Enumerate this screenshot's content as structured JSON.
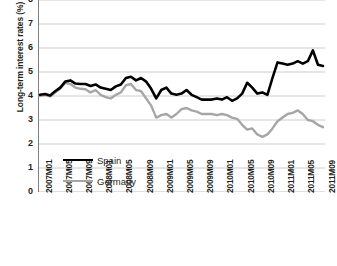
{
  "chart_data": {
    "type": "line",
    "title": "",
    "xlabel": "",
    "ylabel": "Long-term interest rates (%)",
    "ylim": [
      0,
      8
    ],
    "yticks": [
      0,
      1,
      2,
      3,
      4,
      5,
      6,
      7,
      8
    ],
    "ytick_labels": [
      "0",
      "1",
      "2",
      "3",
      "4",
      "5",
      "6",
      "7",
      "8"
    ],
    "grid": true,
    "grid_axis": "y",
    "legend_position": "inside-lower-left",
    "x": [
      "2007M01",
      "2007M02",
      "2007M03",
      "2007M04",
      "2007M05",
      "2007M06",
      "2007M07",
      "2007M08",
      "2007M09",
      "2007M10",
      "2007M11",
      "2007M12",
      "2008M01",
      "2008M02",
      "2008M03",
      "2008M04",
      "2008M05",
      "2008M06",
      "2008M07",
      "2008M08",
      "2008M09",
      "2008M10",
      "2008M11",
      "2008M12",
      "2009M01",
      "2009M02",
      "2009M03",
      "2009M04",
      "2009M05",
      "2009M06",
      "2009M07",
      "2009M08",
      "2009M09",
      "2009M10",
      "2009M11",
      "2009M12",
      "2010M01",
      "2010M02",
      "2010M03",
      "2010M04",
      "2010M05",
      "2010M06",
      "2010M07",
      "2010M08",
      "2010M09",
      "2010M10",
      "2010M11",
      "2010M12",
      "2011M01",
      "2011M02",
      "2011M03",
      "2011M04",
      "2011M05",
      "2011M06",
      "2011M07",
      "2011M08",
      "2011M09"
    ],
    "xtick_labels": [
      "2007M01",
      "2007M05",
      "2007M09",
      "2008M01",
      "2008M05",
      "2008M09",
      "2009M01",
      "2009M05",
      "2009M09",
      "2010M01",
      "2010M05",
      "2010M09",
      "2011M01",
      "2011M05",
      "2011M09"
    ],
    "xtick_indices": [
      0,
      4,
      8,
      12,
      16,
      20,
      24,
      28,
      32,
      36,
      40,
      44,
      48,
      52,
      56
    ],
    "series": [
      {
        "name": "Spain",
        "color": "#000000",
        "width": 2.6,
        "values": [
          4.05,
          4.08,
          4.02,
          4.2,
          4.35,
          4.6,
          4.65,
          4.52,
          4.5,
          4.5,
          4.42,
          4.48,
          4.35,
          4.3,
          4.25,
          4.4,
          4.48,
          4.75,
          4.8,
          4.65,
          4.75,
          4.6,
          4.3,
          3.9,
          4.25,
          4.35,
          4.1,
          4.05,
          4.1,
          4.25,
          4.05,
          3.95,
          3.85,
          3.85,
          3.85,
          3.9,
          3.85,
          3.95,
          3.8,
          3.9,
          4.1,
          4.55,
          4.35,
          4.1,
          4.15,
          4.05,
          4.75,
          5.4,
          5.35,
          5.3,
          5.35,
          5.45,
          5.35,
          5.45,
          5.9,
          5.3,
          5.25
        ]
      },
      {
        "name": "Germany",
        "color": "#a6a6a6",
        "width": 2.4,
        "values": [
          4.0,
          4.05,
          3.98,
          4.15,
          4.3,
          4.55,
          4.5,
          4.35,
          4.3,
          4.28,
          4.15,
          4.25,
          4.05,
          3.95,
          3.9,
          4.05,
          4.15,
          4.45,
          4.5,
          4.25,
          4.2,
          3.9,
          3.6,
          3.1,
          3.2,
          3.25,
          3.1,
          3.25,
          3.45,
          3.5,
          3.4,
          3.35,
          3.25,
          3.25,
          3.25,
          3.2,
          3.25,
          3.2,
          3.1,
          3.05,
          2.8,
          2.6,
          2.65,
          2.4,
          2.3,
          2.4,
          2.65,
          2.95,
          3.1,
          3.25,
          3.3,
          3.4,
          3.25,
          3.0,
          2.95,
          2.8,
          2.7
        ]
      }
    ]
  },
  "legend": {
    "items": [
      {
        "label": "Spain"
      },
      {
        "label": "Germany"
      }
    ]
  },
  "colors": {
    "spain": "#000000",
    "germany": "#a6a6a6",
    "grid": "#bfbfbf",
    "axis": "#808080",
    "text": "#231f20"
  }
}
